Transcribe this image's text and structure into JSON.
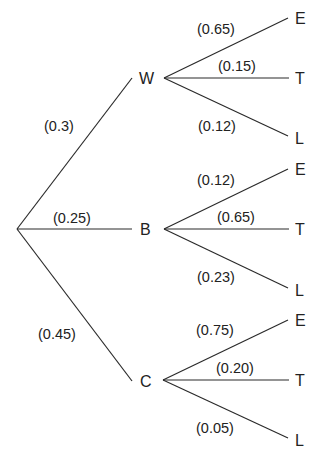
{
  "tree": {
    "root": {
      "label": ""
    },
    "first_level": [
      {
        "node": "W",
        "probability": "(0.3)"
      },
      {
        "node": "B",
        "probability": "(0.25)"
      },
      {
        "node": "C",
        "probability": "(0.45)"
      }
    ],
    "second_level": {
      "W": [
        {
          "node": "E",
          "probability": "(0.65)"
        },
        {
          "node": "T",
          "probability": "(0.15)"
        },
        {
          "node": "L",
          "probability": "(0.12)"
        }
      ],
      "B": [
        {
          "node": "E",
          "probability": "(0.12)"
        },
        {
          "node": "T",
          "probability": "(0.65)"
        },
        {
          "node": "L",
          "probability": "(0.23)"
        }
      ],
      "C": [
        {
          "node": "E",
          "probability": "(0.75)"
        },
        {
          "node": "T",
          "probability": "(0.20)"
        },
        {
          "node": "L",
          "probability": "(0.05)"
        }
      ]
    }
  },
  "colors": {
    "line": "#2a2a2a",
    "text": "#222222",
    "background": "#ffffff"
  }
}
